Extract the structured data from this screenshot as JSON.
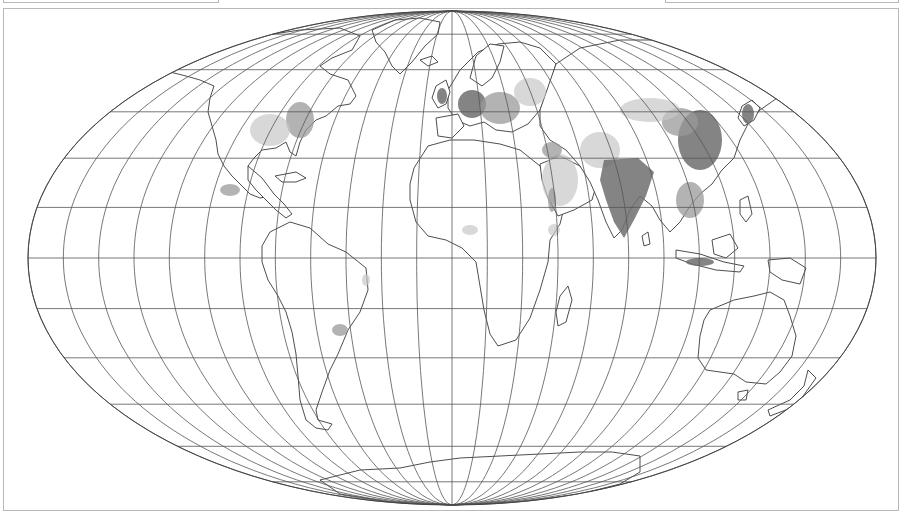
{
  "map": {
    "projection": "pseudocylindrical-equal-area",
    "center": {
      "x": 452,
      "y": 258
    },
    "half_width": 424,
    "half_height": 247,
    "meridian_step_deg": 15,
    "parallel_step_deg": 15,
    "colors": {
      "background": "#ffffff",
      "graticule": "#555555",
      "coastline": "#3a3a3a",
      "frame": "#b8b8b8",
      "density_high": "#6e6e6e",
      "density_mid": "#9a9a9a",
      "density_low": "#c8c8c8"
    },
    "legend": "population density shading (grayscale)",
    "regions": [
      {
        "name": "north-america"
      },
      {
        "name": "south-america"
      },
      {
        "name": "europe"
      },
      {
        "name": "africa"
      },
      {
        "name": "asia"
      },
      {
        "name": "australia"
      },
      {
        "name": "greenland"
      },
      {
        "name": "antarctica"
      },
      {
        "name": "new-zealand"
      },
      {
        "name": "madagascar"
      },
      {
        "name": "japan"
      },
      {
        "name": "uk"
      }
    ]
  },
  "top_panels": {
    "left": {
      "label": ""
    },
    "right": {
      "label": ""
    }
  }
}
